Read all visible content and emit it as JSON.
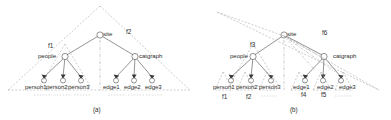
{
  "figure": {
    "type": "diagram",
    "background": "#ffffff",
    "ink_color": "#2e2e2e",
    "dash_color": "#8a8a8a",
    "panels": [
      {
        "id": "a",
        "caption": "(a)",
        "root": {
          "label": "site"
        },
        "internal_nodes": [
          {
            "label": "people"
          },
          {
            "label": "catgraph"
          }
        ],
        "leaves": [
          {
            "label": "person1"
          },
          {
            "label": "person2"
          },
          {
            "label": "person3"
          },
          {
            "label": "edge1"
          },
          {
            "label": "edge2"
          },
          {
            "label": "edge3"
          }
        ],
        "fragments": [
          {
            "label": "f1"
          },
          {
            "label": "f2"
          }
        ]
      },
      {
        "id": "b",
        "caption": "(b)",
        "root": {
          "label": "site"
        },
        "internal_nodes": [
          {
            "label": "people"
          },
          {
            "label": "catgraph"
          }
        ],
        "leaves": [
          {
            "label": "person1"
          },
          {
            "label": "person2"
          },
          {
            "label": "person3"
          },
          {
            "label": "edge1"
          },
          {
            "label": "edge2"
          },
          {
            "label": "edge3"
          }
        ],
        "fragments": [
          {
            "label": "f1"
          },
          {
            "label": "f2"
          },
          {
            "label": "f3"
          },
          {
            "label": "f4"
          },
          {
            "label": "f5"
          },
          {
            "label": "f6"
          }
        ]
      }
    ]
  }
}
